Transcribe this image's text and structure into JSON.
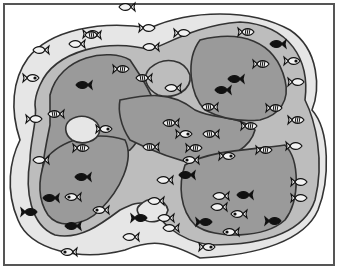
{
  "figure": {
    "width": 338,
    "height": 269,
    "colors": {
      "background": "#ffffff",
      "border": "#555555",
      "zone_outer": "#e6e6e6",
      "zone_middle": "#bdbdbd",
      "zone_inner": "#9a9a9a",
      "outline": "#333333",
      "fish_dark": "#111111",
      "fish_light": "#f2f2f2"
    },
    "zones": {
      "outer": "M28,58 C50,30 100,20 150,28 C190,10 250,8 290,30 C320,50 320,90 312,110 C330,130 330,180 318,210 C305,240 260,255 200,258 C165,240 150,240 125,250 C80,262 30,250 18,220 C5,190 10,160 20,140 C10,110 12,80 28,58 Z",
      "middle": "M40,85 C55,50 110,38 150,50 C175,40 200,25 240,22 C290,25 310,60 305,100 C315,120 325,160 315,200 C305,230 270,245 210,245 C175,240 160,220 150,205 C140,200 130,205 120,210 C100,225 80,240 55,235 C30,225 25,190 30,160 C30,140 38,120 35,105 C35,95 38,90 40,85 Z",
      "inner_left": "M50,95 C60,55 110,48 130,60 C140,75 150,90 155,105 C150,120 140,140 130,150 C120,155 100,160 90,170 C70,185 50,220 45,200 C38,180 45,150 50,125 Z",
      "inner_center": "M120,100 C145,95 170,90 195,110 C215,120 240,115 255,130 C250,150 225,160 200,165 C175,160 150,150 130,140 C120,125 118,110 120,100 Z",
      "inner_right_top": "M200,40 C240,30 275,40 285,80 C290,100 280,115 260,120 C240,122 220,118 205,110 C190,95 185,60 200,40 Z",
      "inner_left_bottom": "M45,160 C60,140 95,130 125,140 C135,160 120,190 100,210 C85,225 60,230 48,215 C38,200 38,180 45,160 Z",
      "inner_right_bottom": "M185,165 C210,150 250,150 285,145 C300,160 300,200 285,220 C265,238 215,240 195,225 C180,210 178,185 185,165 Z",
      "pocket_top": "M150,68 C165,55 185,60 190,75 C192,90 175,100 158,95 C145,88 142,76 150,68 Z",
      "pocket_left": "M70,120 C82,112 98,118 100,130 C98,142 82,146 72,140 C64,134 64,125 70,120 Z",
      "pocket_bottom": "M140,205 C150,195 165,198 168,210 C165,222 150,225 142,218 C136,212 136,208 140,205 Z"
    },
    "fish": [
      {
        "x": 92,
        "y": 34,
        "s": 1,
        "dir": -1,
        "style": "outline"
      },
      {
        "x": 148,
        "y": 28,
        "s": 1,
        "dir": -1,
        "style": "outline"
      },
      {
        "x": 150,
        "y": 47,
        "s": 1,
        "dir": 1,
        "style": "outline"
      },
      {
        "x": 40,
        "y": 50,
        "s": 1,
        "dir": 1,
        "style": "outline"
      },
      {
        "x": 32,
        "y": 78,
        "s": 1,
        "dir": -1,
        "style": "eye"
      },
      {
        "x": 92,
        "y": 35,
        "s": 1,
        "dir": 1,
        "style": "striped"
      },
      {
        "x": 76,
        "y": 44,
        "s": 1,
        "dir": 1,
        "style": "outline"
      },
      {
        "x": 122,
        "y": 69,
        "s": 1,
        "dir": -1,
        "style": "striped"
      },
      {
        "x": 143,
        "y": 78,
        "s": 1,
        "dir": 1,
        "style": "striped"
      },
      {
        "x": 83,
        "y": 85,
        "s": 1,
        "dir": 1,
        "style": "dark"
      },
      {
        "x": 55,
        "y": 114,
        "s": 1,
        "dir": 1,
        "style": "striped"
      },
      {
        "x": 35,
        "y": 119,
        "s": 1,
        "dir": -1,
        "style": "outline"
      },
      {
        "x": 105,
        "y": 129,
        "s": 1,
        "dir": -1,
        "style": "eye"
      },
      {
        "x": 172,
        "y": 88,
        "s": 1,
        "dir": 1,
        "style": "outline"
      },
      {
        "x": 183,
        "y": 33,
        "s": 1,
        "dir": -1,
        "style": "outline"
      },
      {
        "x": 247,
        "y": 32,
        "s": 1,
        "dir": -1,
        "style": "striped"
      },
      {
        "x": 277,
        "y": 44,
        "s": 1,
        "dir": 1,
        "style": "dark"
      },
      {
        "x": 293,
        "y": 61,
        "s": 1,
        "dir": -1,
        "style": "eye"
      },
      {
        "x": 297,
        "y": 82,
        "s": 1,
        "dir": -1,
        "style": "outline"
      },
      {
        "x": 262,
        "y": 64,
        "s": 1,
        "dir": -1,
        "style": "striped"
      },
      {
        "x": 235,
        "y": 79,
        "s": 1,
        "dir": 1,
        "style": "dark"
      },
      {
        "x": 222,
        "y": 90,
        "s": 1,
        "dir": 1,
        "style": "dark"
      },
      {
        "x": 209,
        "y": 107,
        "s": 1,
        "dir": 1,
        "style": "striped"
      },
      {
        "x": 275,
        "y": 108,
        "s": 1,
        "dir": -1,
        "style": "striped"
      },
      {
        "x": 297,
        "y": 120,
        "s": 1,
        "dir": -1,
        "style": "striped"
      },
      {
        "x": 250,
        "y": 126,
        "s": 1,
        "dir": -1,
        "style": "striped"
      },
      {
        "x": 170,
        "y": 123,
        "s": 1,
        "dir": 1,
        "style": "striped"
      },
      {
        "x": 150,
        "y": 147,
        "s": 1,
        "dir": 1,
        "style": "striped"
      },
      {
        "x": 185,
        "y": 134,
        "s": 1,
        "dir": -1,
        "style": "eye"
      },
      {
        "x": 195,
        "y": 148,
        "s": 1,
        "dir": -1,
        "style": "striped"
      },
      {
        "x": 190,
        "y": 160,
        "s": 1,
        "dir": 1,
        "style": "eye"
      },
      {
        "x": 228,
        "y": 156,
        "s": 1,
        "dir": -1,
        "style": "eye"
      },
      {
        "x": 265,
        "y": 150,
        "s": 1,
        "dir": -1,
        "style": "striped"
      },
      {
        "x": 295,
        "y": 146,
        "s": 1,
        "dir": -1,
        "style": "outline"
      },
      {
        "x": 210,
        "y": 134,
        "s": 1,
        "dir": 1,
        "style": "striped"
      },
      {
        "x": 186,
        "y": 175,
        "s": 1,
        "dir": 1,
        "style": "dark"
      },
      {
        "x": 220,
        "y": 196,
        "s": 1,
        "dir": 1,
        "style": "outline"
      },
      {
        "x": 244,
        "y": 195,
        "s": 1,
        "dir": 1,
        "style": "dark"
      },
      {
        "x": 218,
        "y": 207,
        "s": 1,
        "dir": 1,
        "style": "outline"
      },
      {
        "x": 238,
        "y": 214,
        "s": 1,
        "dir": 1,
        "style": "eye"
      },
      {
        "x": 205,
        "y": 222,
        "s": 1,
        "dir": -1,
        "style": "dark"
      },
      {
        "x": 230,
        "y": 232,
        "s": 1,
        "dir": 1,
        "style": "eye"
      },
      {
        "x": 274,
        "y": 221,
        "s": 1,
        "dir": -1,
        "style": "dark"
      },
      {
        "x": 300,
        "y": 182,
        "s": 1,
        "dir": -1,
        "style": "outline"
      },
      {
        "x": 300,
        "y": 198,
        "s": 1,
        "dir": -1,
        "style": "outline"
      },
      {
        "x": 208,
        "y": 247,
        "s": 1,
        "dir": -1,
        "style": "eye"
      },
      {
        "x": 82,
        "y": 177,
        "s": 1,
        "dir": 1,
        "style": "dark"
      },
      {
        "x": 50,
        "y": 198,
        "s": 1,
        "dir": 1,
        "style": "dark"
      },
      {
        "x": 72,
        "y": 197,
        "s": 1,
        "dir": 1,
        "style": "eye"
      },
      {
        "x": 100,
        "y": 210,
        "s": 1,
        "dir": 1,
        "style": "eye"
      },
      {
        "x": 30,
        "y": 212,
        "s": 1,
        "dir": -1,
        "style": "dark"
      },
      {
        "x": 72,
        "y": 226,
        "s": 1,
        "dir": 1,
        "style": "dark"
      },
      {
        "x": 40,
        "y": 160,
        "s": 1,
        "dir": 1,
        "style": "outline"
      },
      {
        "x": 82,
        "y": 148,
        "s": 1,
        "dir": -1,
        "style": "striped"
      },
      {
        "x": 155,
        "y": 201,
        "s": 1,
        "dir": 1,
        "style": "outline"
      },
      {
        "x": 140,
        "y": 218,
        "s": 1,
        "dir": -1,
        "style": "dark"
      },
      {
        "x": 165,
        "y": 218,
        "s": 1,
        "dir": 1,
        "style": "outline"
      },
      {
        "x": 170,
        "y": 228,
        "s": 1,
        "dir": 1,
        "style": "outline"
      },
      {
        "x": 130,
        "y": 237,
        "s": 1,
        "dir": 1,
        "style": "outline"
      },
      {
        "x": 68,
        "y": 252,
        "s": 1,
        "dir": 1,
        "style": "eye"
      },
      {
        "x": 164,
        "y": 180,
        "s": 1,
        "dir": 1,
        "style": "outline"
      },
      {
        "x": 126,
        "y": 7,
        "s": 1,
        "dir": 1,
        "style": "outline"
      }
    ]
  }
}
